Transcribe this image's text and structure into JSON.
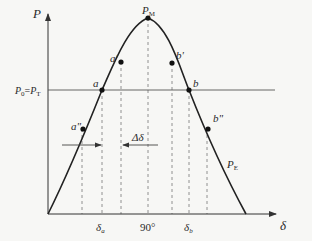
{
  "diagram": {
    "axes": {
      "y_label": "P",
      "x_label": "δ"
    },
    "curve_label": {
      "main": "P",
      "sub": "E"
    },
    "peak_label": {
      "main": "P",
      "sub": "M"
    },
    "line_label": {
      "left_main": "P",
      "left_sub": "0",
      "eq": "=",
      "right_main": "P",
      "right_sub": "T"
    },
    "points": [
      {
        "id": "a",
        "label": "a"
      },
      {
        "id": "a1",
        "label": "a'"
      },
      {
        "id": "a2",
        "label": "a\""
      },
      {
        "id": "b",
        "label": "b"
      },
      {
        "id": "b1",
        "label": "b'"
      },
      {
        "id": "b2",
        "label": "b\""
      }
    ],
    "ticks": {
      "delta_a": {
        "main": "δ",
        "sub": "a"
      },
      "ninety": "90°",
      "delta_b": {
        "main": "δ",
        "sub": "b"
      }
    },
    "delta_delta": "Δδ",
    "colors": {
      "line": "#222222",
      "horizontal": "#555555",
      "dashed": "#777777",
      "background": "#f7f7f5"
    }
  }
}
